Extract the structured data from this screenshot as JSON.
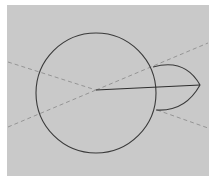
{
  "figure": {
    "background": "#c9c9c9",
    "page_background": "#ffffff",
    "stroke_color": "#3a3a3a",
    "dashed_color": "#8e8e8e",
    "elements": {
      "circle": {
        "cx": 96,
        "cy": 93,
        "r": 60
      },
      "center_point": {
        "x": 96,
        "y": 90
      },
      "radius_line": {
        "x1": 96,
        "y1": 90,
        "x2": 200,
        "y2": 85
      },
      "lens_tip": {
        "x": 200,
        "y": 85
      },
      "dashed_lines": [
        {
          "x1": 8,
          "y1": 62,
          "x2": 96,
          "y2": 90
        },
        {
          "x1": 96,
          "y1": 90,
          "x2": 208,
          "y2": 43
        },
        {
          "x1": 8,
          "y1": 127,
          "x2": 96,
          "y2": 90
        },
        {
          "x1": 157,
          "y1": 110,
          "x2": 208,
          "y2": 128
        }
      ]
    }
  }
}
